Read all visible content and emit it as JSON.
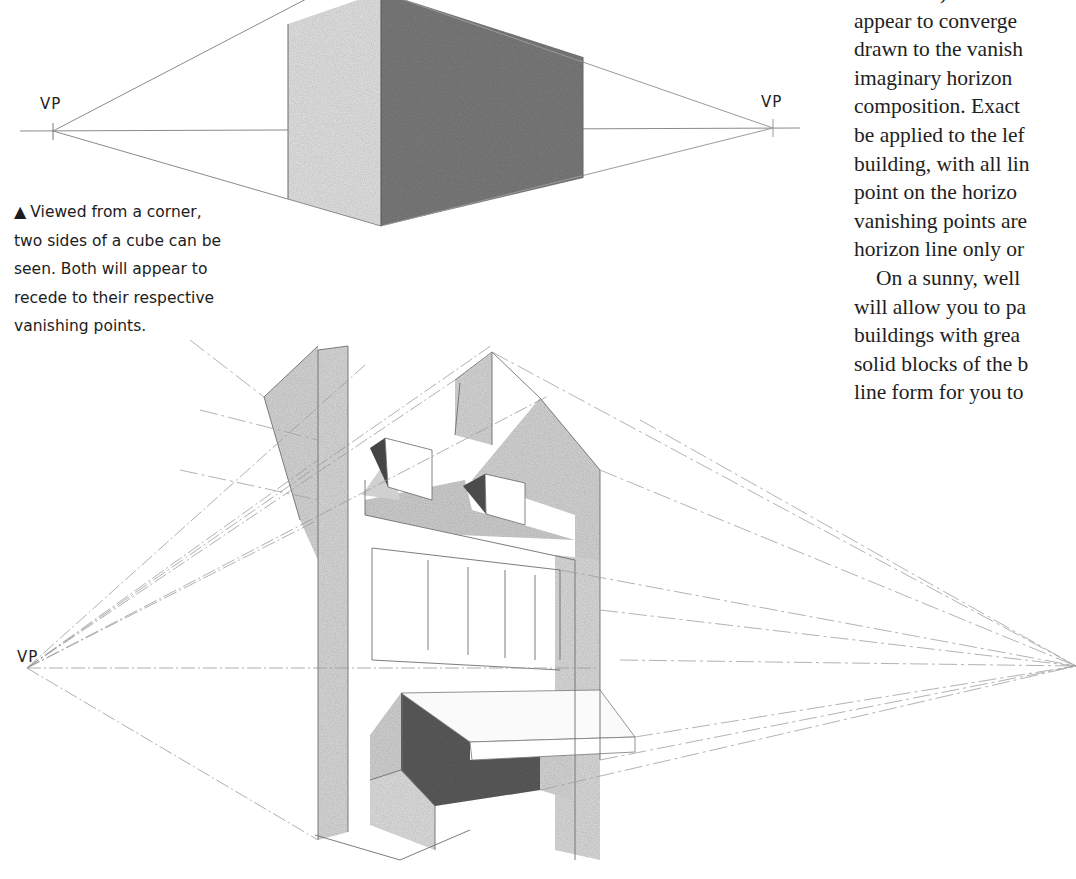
{
  "top_figure": {
    "vp_left_label": "VP",
    "vp_right_label": "VP",
    "description": "Two-point perspective cube viewed from a corner"
  },
  "caption": {
    "marker": "▲",
    "text": "Viewed from a corner, two sides of a cube can be seen. Both will appear to recede to their respective vanishing points.",
    "lines": [
      "Viewed from a corner,",
      "two sides of a cube can be",
      "seen. Both will appear to",
      "recede to their respective",
      "vanishing points."
    ]
  },
  "bottom_figure": {
    "vp_left_label": "VP",
    "description": "Two-point perspective sketch of a building facade with awning and dormers"
  },
  "body_text": {
    "lines": [
      "architrave) on the r",
      "appear to converge",
      "drawn to the vanish",
      "imaginary horizon",
      "composition. Exact",
      "be applied to the lef",
      "building, with all lin",
      "point on the horizo",
      "vanishing points are",
      "horizon line only or",
      "On a sunny, well",
      "will allow you to pa",
      "buildings with grea",
      "solid blocks of the b",
      "line form for you to"
    ]
  },
  "colors": {
    "paper": "#ffffff",
    "ink": "#1e1e1e",
    "pencil": "#8a8a8a",
    "shadow_dark": "#5a5a5a",
    "shadow_mid": "#8c8c8c",
    "wash_light": "#d8d8d8",
    "wash_lighter": "#e8e8e8"
  }
}
